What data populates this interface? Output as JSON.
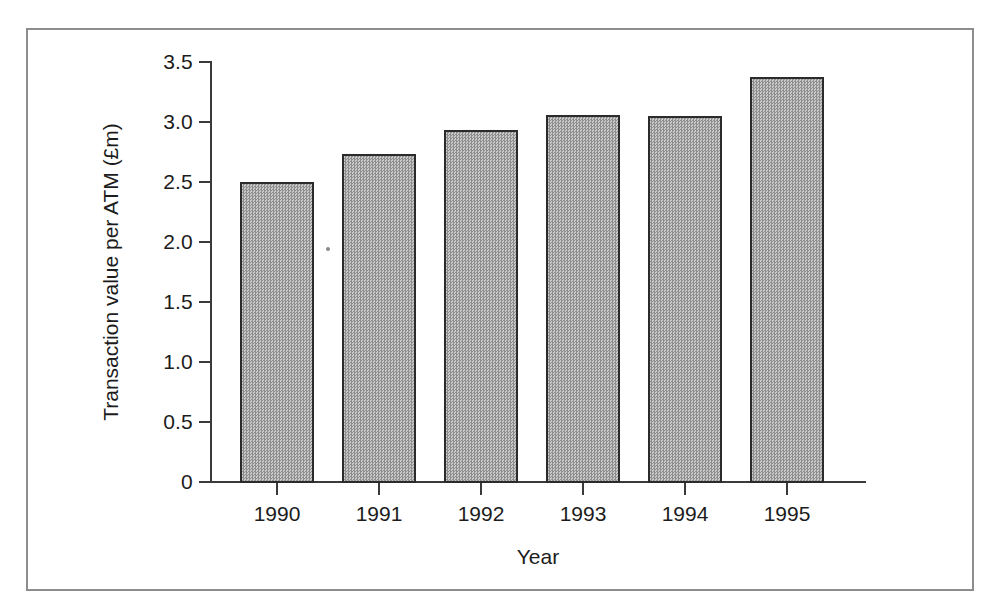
{
  "figure": {
    "background_color": "#ffffff",
    "frame_color": "#8d8d8d",
    "axis_color": "#3a3a3a",
    "bar_fill_color": "#a9a9a9",
    "bar_edge_color": "#2b2b2b"
  },
  "chart_data": {
    "type": "bar",
    "title": "",
    "subtitle": "",
    "xlabel": "Year",
    "ylabel": "Transaction value per ATM (£m)",
    "categories": [
      "1990",
      "1991",
      "1992",
      "1993",
      "1994",
      "1995"
    ],
    "values": [
      2.51,
      2.74,
      2.94,
      3.07,
      3.06,
      3.38
    ],
    "ylim": [
      0,
      3.5
    ],
    "ytick_labels": [
      "0",
      "0.5",
      "1.0",
      "1.5",
      "2.0",
      "2.5",
      "3.0",
      "3.5"
    ],
    "ytick_values": [
      0,
      0.5,
      1.0,
      1.5,
      2.0,
      2.5,
      3.0,
      3.5
    ],
    "grid": false,
    "legend": null,
    "legend_position": "none",
    "annotations": []
  }
}
